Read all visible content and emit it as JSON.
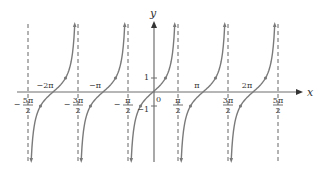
{
  "chart_data": {
    "type": "line",
    "title": "",
    "function": "y = tan x",
    "xlabel": "x",
    "ylabel": "y",
    "xlim": [
      -2.5,
      2.5
    ],
    "xlim_note": "in units of pi",
    "ylim": [
      -5,
      5
    ],
    "grid": false,
    "legend": null,
    "asymptotes": [
      "-5π/2",
      "-3π/2",
      "-π/2",
      "π/2",
      "3π/2",
      "5π/2"
    ],
    "asymptote_values_pi": [
      -2.5,
      -1.5,
      -0.5,
      0.5,
      1.5,
      2.5
    ],
    "x_tick_labels_below": [
      {
        "num": "5π",
        "den": "2",
        "sign": "−",
        "x_pi": -2.5
      },
      {
        "num": "3π",
        "den": "2",
        "sign": "−",
        "x_pi": -1.5
      },
      {
        "num": "π",
        "den": "2",
        "sign": "−",
        "x_pi": -0.5
      },
      {
        "num": "π",
        "den": "2",
        "sign": "",
        "x_pi": 0.5
      },
      {
        "num": "3π",
        "den": "2",
        "sign": "",
        "x_pi": 1.5
      },
      {
        "num": "5π",
        "den": "2",
        "sign": "",
        "x_pi": 2.5
      }
    ],
    "x_tick_labels_above": [
      {
        "text": "−2π",
        "x_pi": -2
      },
      {
        "text": "−π",
        "x_pi": -1
      },
      {
        "text": "π",
        "x_pi": 1
      },
      {
        "text": "2π",
        "x_pi": 2
      }
    ],
    "y_tick_labels": [
      {
        "text": "1",
        "y": 1
      },
      {
        "text": "−1",
        "y": -1
      }
    ],
    "origin_label": "0",
    "marked_points": [
      {
        "x_pi": -2.25,
        "y": -1
      },
      {
        "x_pi": -1.75,
        "y": 1
      },
      {
        "x_pi": -1.25,
        "y": -1
      },
      {
        "x_pi": -0.75,
        "y": 1
      },
      {
        "x_pi": -0.25,
        "y": -1
      },
      {
        "x_pi": 0.25,
        "y": 1
      },
      {
        "x_pi": 0.75,
        "y": -1
      },
      {
        "x_pi": 1.25,
        "y": 1
      },
      {
        "x_pi": 1.75,
        "y": -1
      },
      {
        "x_pi": 2.25,
        "y": 1
      }
    ],
    "branches_centered_at_pi": [
      -2,
      -1,
      0,
      1,
      2
    ],
    "colors": {
      "curve": "#7a7a7a",
      "axis": "#6f6f6f",
      "asymptote": "#555555",
      "text": "#333333"
    }
  }
}
